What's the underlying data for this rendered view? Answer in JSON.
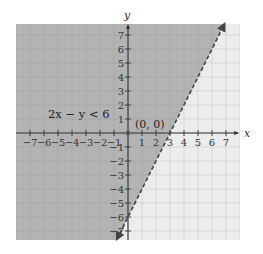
{
  "chart_data": {
    "type": "area",
    "title": "",
    "xlabel": "x",
    "ylabel": "y",
    "xlim": [
      -8,
      8
    ],
    "ylim": [
      -7.6,
      7.8
    ],
    "grid": true,
    "grid_step": 1,
    "x_ticks": [
      -7,
      -6,
      -5,
      -4,
      -3,
      -2,
      -1,
      1,
      2,
      3,
      4,
      5,
      6,
      7
    ],
    "y_ticks": [
      -7,
      -6,
      -5,
      -4,
      -3,
      -2,
      -1,
      1,
      2,
      3,
      4,
      5,
      6,
      7
    ],
    "x_tick_labels": [
      "−7",
      "−6",
      "−5",
      "−4",
      "−3",
      "−2",
      "−1",
      "1",
      "2",
      "3",
      "4",
      "5",
      "6",
      "7"
    ],
    "y_tick_labels": [
      "−7",
      "−6",
      "−5",
      "−4",
      "−3",
      "−2",
      "−1",
      "1",
      "2",
      "3",
      "4",
      "5",
      "6",
      "7"
    ],
    "boundary_line": {
      "equation": "2x − y = 6",
      "slope": 2,
      "intercept": -6,
      "style": "dashed",
      "arrows": "both",
      "x_range": [
        -0.8,
        6.9
      ]
    },
    "shaded_region": {
      "inequality": "2x − y < 6",
      "side": "left/above line",
      "color": "#b3b3b3"
    },
    "unshaded_color": "#ececec",
    "test_point": {
      "x": 0,
      "y": 0,
      "label": "(0, 0)"
    },
    "annotations": [
      {
        "text": "2x − y < 6",
        "x": -4.8,
        "y": 1.4
      },
      {
        "text": "(0, 0)",
        "x": 0.5,
        "y": 0.6
      }
    ],
    "origin_px": [
      128,
      133
    ],
    "unit_px": 14
  },
  "labels": {
    "x_axis": "x",
    "y_axis": "y",
    "inequality": "2x − y < 6",
    "test_point": "(0, 0)"
  },
  "colors": {
    "shaded": "#b3b3b3",
    "shaded_grid": "#a3a3a3",
    "unshaded": "#ececec",
    "unshaded_grid": "#cfcfcf",
    "axis": "#333333",
    "line": "#444444"
  }
}
